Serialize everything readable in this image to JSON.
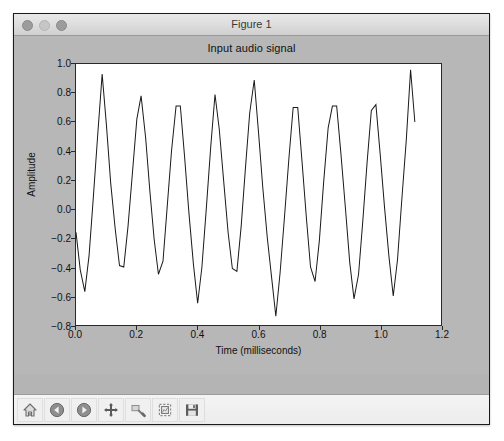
{
  "window": {
    "title": "Figure 1",
    "controls": [
      {
        "name": "close-button",
        "state": "inactive"
      },
      {
        "name": "minimize-button",
        "state": "inactive"
      },
      {
        "name": "zoom-button",
        "state": "inactive"
      }
    ]
  },
  "toolbar": {
    "buttons": [
      {
        "name": "home-icon",
        "label": "Home"
      },
      {
        "name": "back-arrow-icon",
        "label": "Back"
      },
      {
        "name": "forward-arrow-icon",
        "label": "Forward"
      },
      {
        "name": "pan-move-icon",
        "label": "Pan"
      },
      {
        "name": "zoom-rect-icon",
        "label": "Zoom to rectangle"
      },
      {
        "name": "configure-subplots-icon",
        "label": "Configure subplots"
      },
      {
        "name": "save-floppy-icon",
        "label": "Save"
      }
    ]
  },
  "chart_data": {
    "type": "line",
    "title": "Input audio signal",
    "xlabel": "Time (milliseconds)",
    "ylabel": "Amplitude",
    "xlim": [
      0.0,
      1.2
    ],
    "ylim": [
      -0.8,
      1.0
    ],
    "xticks": [
      0.0,
      0.2,
      0.4,
      0.6,
      0.8,
      1.0,
      1.2
    ],
    "xtick_labels": [
      "0.0",
      "0.2",
      "0.4",
      "0.6",
      "0.8",
      "1.0",
      "1.2"
    ],
    "yticks": [
      1.0,
      0.8,
      0.6,
      0.4,
      0.2,
      0.0,
      -0.2,
      -0.4,
      -0.6,
      -0.8
    ],
    "ytick_labels": [
      "1.0",
      "0.8",
      "0.6",
      "0.4",
      "0.2",
      "0.0",
      "−0.2",
      "−0.4",
      "−0.6",
      "−0.8"
    ],
    "grid": false,
    "legend": null,
    "line_color": "#1a1a1a",
    "line_width": 1,
    "series": [
      {
        "name": "audio",
        "x": [
          0.0,
          0.014,
          0.029,
          0.043,
          0.057,
          0.071,
          0.086,
          0.1,
          0.114,
          0.129,
          0.143,
          0.157,
          0.171,
          0.186,
          0.2,
          0.214,
          0.229,
          0.243,
          0.257,
          0.271,
          0.286,
          0.3,
          0.314,
          0.329,
          0.343,
          0.357,
          0.371,
          0.386,
          0.4,
          0.414,
          0.429,
          0.443,
          0.457,
          0.471,
          0.486,
          0.5,
          0.514,
          0.529,
          0.543,
          0.557,
          0.571,
          0.586,
          0.6,
          0.614,
          0.629,
          0.643,
          0.657,
          0.671,
          0.686,
          0.7,
          0.714,
          0.729,
          0.743,
          0.757,
          0.771,
          0.786,
          0.8,
          0.814,
          0.829,
          0.843,
          0.857,
          0.871,
          0.886,
          0.9,
          0.914,
          0.929,
          0.943,
          0.957,
          0.971,
          0.986,
          1.0,
          1.014,
          1.029,
          1.043,
          1.057,
          1.071,
          1.086,
          1.1,
          1.114
        ],
        "y": [
          -0.16,
          -0.42,
          -0.57,
          -0.32,
          0.08,
          0.5,
          0.93,
          0.58,
          0.18,
          -0.14,
          -0.39,
          -0.4,
          -0.12,
          0.26,
          0.62,
          0.78,
          0.49,
          0.12,
          -0.21,
          -0.45,
          -0.36,
          0.02,
          0.4,
          0.71,
          0.71,
          0.36,
          -0.02,
          -0.38,
          -0.65,
          -0.4,
          0.02,
          0.43,
          0.79,
          0.55,
          0.18,
          -0.16,
          -0.41,
          -0.43,
          -0.12,
          0.28,
          0.66,
          0.89,
          0.53,
          0.15,
          -0.2,
          -0.47,
          -0.74,
          -0.44,
          -0.04,
          0.35,
          0.7,
          0.7,
          0.33,
          -0.05,
          -0.4,
          -0.5,
          -0.22,
          0.18,
          0.56,
          0.71,
          0.71,
          0.38,
          0.0,
          -0.37,
          -0.62,
          -0.45,
          -0.08,
          0.32,
          0.68,
          0.72,
          0.38,
          0.02,
          -0.33,
          -0.6,
          -0.35,
          0.06,
          0.48,
          0.96,
          0.6
        ]
      }
    ]
  }
}
